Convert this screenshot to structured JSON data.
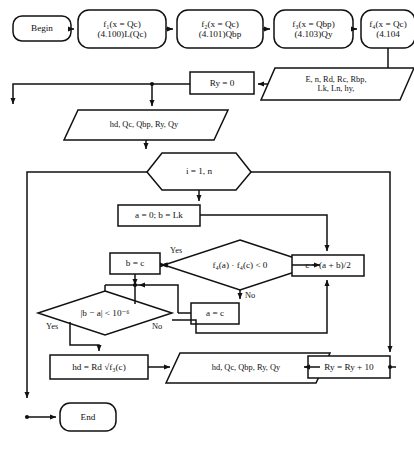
{
  "diagram": {
    "type": "flowchart",
    "line_color": "#111111",
    "fill_color": "#ffffff",
    "text_color": "#111111"
  },
  "nodes": {
    "begin": {
      "shape": "terminator",
      "label": "Begin"
    },
    "f1": {
      "shape": "terminator",
      "line1": "f₁(x = Qc)",
      "line2": "(4.100)L(Qc)"
    },
    "f2": {
      "shape": "terminator",
      "line1": "f₂(x = Qc)",
      "line2": "(4.101)Qbp"
    },
    "f3": {
      "shape": "terminator",
      "line1": "f₃(x = Qbp)",
      "line2": "(4.103)Qy"
    },
    "f4": {
      "shape": "terminator",
      "line1": "f₄(x = Qc)",
      "line2": "(4.104"
    },
    "input_params": {
      "shape": "parallelogram",
      "line1": "E, n, Rd, Rc, Rbp,",
      "line2": "Lk, Ln, hy,"
    },
    "ry_init": {
      "shape": "process",
      "label": "Ry = 0"
    },
    "output_top": {
      "shape": "parallelogram",
      "label": "hd, Qc, Qbp, Ry, Qy"
    },
    "loop": {
      "shape": "hexagon",
      "label": "i = 1, n"
    },
    "init_ab": {
      "shape": "process",
      "label": "a = 0; b = Lk"
    },
    "sign_test": {
      "shape": "decision",
      "label": "f₄(a) · f₄(c) < 0"
    },
    "b_assign": {
      "shape": "process",
      "label": "b = c"
    },
    "c_midpoint": {
      "shape": "process",
      "label": "c = (a + b)/2"
    },
    "a_assign": {
      "shape": "process",
      "label": "a = c"
    },
    "tol_test": {
      "shape": "decision",
      "label": "|b − a| < 10⁻⁶"
    },
    "hd_calc": {
      "shape": "process",
      "label": "hd = Rd √f₃(c)"
    },
    "output_bottom": {
      "shape": "parallelogram",
      "label": "hd, Qc, Qbp, Ry, Qy"
    },
    "ry_increment": {
      "shape": "process",
      "label": "Ry = Ry + 10"
    },
    "end": {
      "shape": "terminator",
      "label": "End"
    }
  },
  "edge_labels": {
    "sign_yes": "Yes",
    "sign_no": "No",
    "tol_yes": "Yes",
    "tol_no": "No"
  }
}
